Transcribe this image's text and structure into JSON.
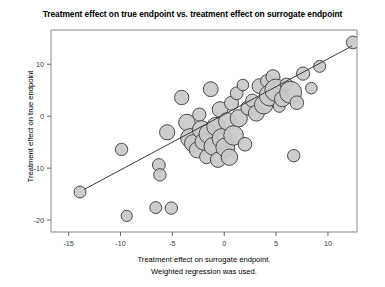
{
  "chart_data": {
    "type": "scatter",
    "title": "Treatment effect on true endpoint vs. treatment effect on surrogate endpoint",
    "xlabel_line1": "Treatment effect on surrogate endpoint.",
    "xlabel_line2": "Weighted regression was used.",
    "ylabel": "Treatment effect on true endpoint",
    "xlim": [
      -16.7,
      12.8
    ],
    "ylim": [
      -22.3,
      16.6
    ],
    "xticks": [
      -15,
      -10,
      -5,
      0,
      5,
      10
    ],
    "xtick_labels": [
      "-15",
      "-10",
      "-5",
      "0",
      "5",
      "10"
    ],
    "yticks": [
      10,
      0,
      -10,
      -20
    ],
    "ytick_labels": [
      "10",
      "0",
      "-10",
      "-20"
    ],
    "grid": false,
    "legend": null,
    "marker_style": "bubble",
    "marker_fill": "#c9c9c9",
    "marker_edge": "#4a4a4a",
    "regression_line": {
      "x_start": -13.5,
      "y_start": -14.1,
      "x_end": 12.3,
      "y_end": 13.5,
      "color": "#3a3a3a",
      "width": 1.0
    },
    "points": [
      {
        "x": -13.9,
        "y": -14.6,
        "size": 6.0
      },
      {
        "x": -9.9,
        "y": -6.4,
        "size": 6.2
      },
      {
        "x": -9.4,
        "y": -19.2,
        "size": 5.6
      },
      {
        "x": -6.6,
        "y": -17.6,
        "size": 6.0
      },
      {
        "x": -6.3,
        "y": -9.4,
        "size": 6.4
      },
      {
        "x": -6.2,
        "y": -11.3,
        "size": 6.2
      },
      {
        "x": -5.5,
        "y": -3.1,
        "size": 7.6
      },
      {
        "x": -5.1,
        "y": -17.7,
        "size": 6.2
      },
      {
        "x": -4.1,
        "y": 3.6,
        "size": 7.2
      },
      {
        "x": -3.6,
        "y": -1.2,
        "size": 8.2
      },
      {
        "x": -3.3,
        "y": -4.2,
        "size": 9.4
      },
      {
        "x": -3.0,
        "y": -5.2,
        "size": 8.6
      },
      {
        "x": -2.6,
        "y": -6.5,
        "size": 8.0
      },
      {
        "x": -2.4,
        "y": 0.3,
        "size": 6.6
      },
      {
        "x": -2.2,
        "y": -2.6,
        "size": 9.0
      },
      {
        "x": -2.0,
        "y": -4.9,
        "size": 8.4
      },
      {
        "x": -1.7,
        "y": -7.8,
        "size": 7.0
      },
      {
        "x": -1.5,
        "y": -3.4,
        "size": 9.6
      },
      {
        "x": -1.3,
        "y": 5.2,
        "size": 7.4
      },
      {
        "x": -1.1,
        "y": -5.8,
        "size": 8.8
      },
      {
        "x": -0.8,
        "y": -2.0,
        "size": 9.2
      },
      {
        "x": -0.6,
        "y": -8.4,
        "size": 7.6
      },
      {
        "x": -0.4,
        "y": 1.3,
        "size": 7.8
      },
      {
        "x": -0.2,
        "y": -4.3,
        "size": 10.0
      },
      {
        "x": 0.1,
        "y": -6.0,
        "size": 9.4
      },
      {
        "x": 0.3,
        "y": -1.0,
        "size": 8.8
      },
      {
        "x": 0.5,
        "y": -7.9,
        "size": 8.2
      },
      {
        "x": 0.7,
        "y": 2.5,
        "size": 7.0
      },
      {
        "x": 0.9,
        "y": -3.7,
        "size": 9.8
      },
      {
        "x": 1.2,
        "y": 4.4,
        "size": 6.4
      },
      {
        "x": 1.4,
        "y": -0.4,
        "size": 8.6
      },
      {
        "x": 1.8,
        "y": 6.0,
        "size": 5.8
      },
      {
        "x": 2.0,
        "y": -5.4,
        "size": 6.8
      },
      {
        "x": 2.3,
        "y": 1.6,
        "size": 7.2
      },
      {
        "x": 2.7,
        "y": 3.0,
        "size": 6.6
      },
      {
        "x": 3.1,
        "y": 0.6,
        "size": 8.0
      },
      {
        "x": 3.4,
        "y": 5.8,
        "size": 7.4
      },
      {
        "x": 3.8,
        "y": 2.2,
        "size": 9.2
      },
      {
        "x": 4.1,
        "y": 6.8,
        "size": 6.2
      },
      {
        "x": 4.4,
        "y": 4.0,
        "size": 10.6
      },
      {
        "x": 4.7,
        "y": 7.6,
        "size": 7.0
      },
      {
        "x": 5.0,
        "y": 5.0,
        "size": 11.2
      },
      {
        "x": 5.3,
        "y": 1.9,
        "size": 6.0
      },
      {
        "x": 5.6,
        "y": 3.3,
        "size": 7.8
      },
      {
        "x": 6.0,
        "y": 6.1,
        "size": 6.4
      },
      {
        "x": 6.4,
        "y": 4.6,
        "size": 11.0
      },
      {
        "x": 6.7,
        "y": -7.6,
        "size": 6.2
      },
      {
        "x": 7.0,
        "y": 2.6,
        "size": 6.8
      },
      {
        "x": 7.6,
        "y": 8.2,
        "size": 6.6
      },
      {
        "x": 8.4,
        "y": 5.4,
        "size": 5.8
      },
      {
        "x": 9.2,
        "y": 9.6,
        "size": 6.0
      },
      {
        "x": 12.4,
        "y": 14.2,
        "size": 6.4
      }
    ]
  }
}
